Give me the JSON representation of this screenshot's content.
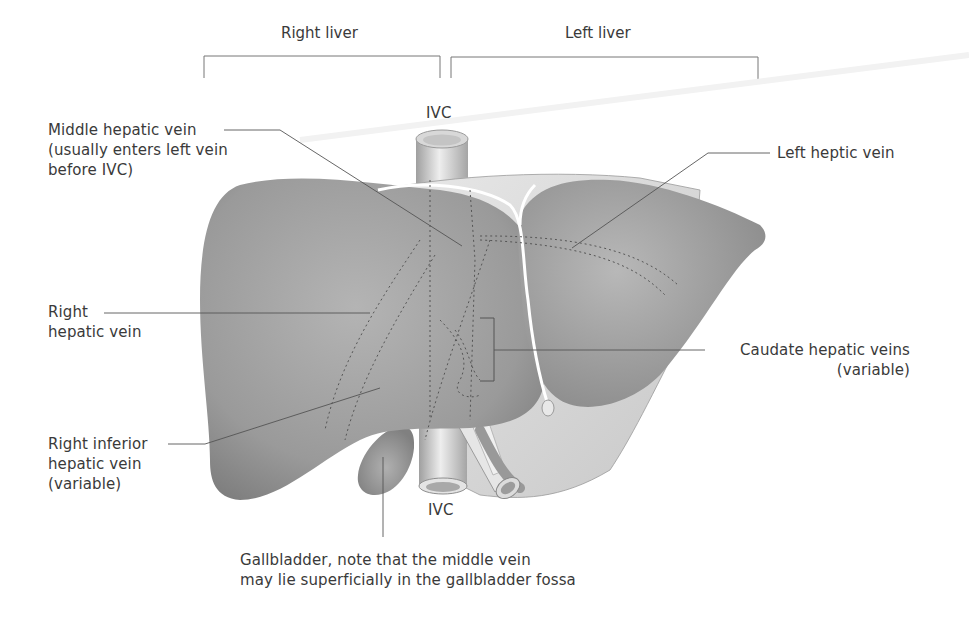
{
  "headers": {
    "right_liver": "Right liver",
    "left_liver": "Left liver"
  },
  "labels": {
    "ivc_top": "IVC",
    "ivc_bottom": "IVC",
    "middle_hepatic_vein": [
      "Middle hepatic vein",
      "(usually enters left vein",
      "before IVC)"
    ],
    "left_hepatic_vein": "Left heptic vein",
    "right_hepatic_vein": [
      "Right",
      "hepatic vein"
    ],
    "caudate_hepatic_veins": [
      "Caudate hepatic veins",
      "(variable)"
    ],
    "right_inferior_hepatic_vein": [
      "Right inferior",
      "hepatic vein",
      "(variable)"
    ],
    "gallbladder": [
      "Gallbladder, note that the middle vein",
      "may lie superficially in the gallbladder fossa"
    ]
  },
  "colors": {
    "liver_fill": "#9a9a9a",
    "liver_light": "#bdbdbd",
    "leader_line": "#555555",
    "text": "#3a3a3a"
  }
}
